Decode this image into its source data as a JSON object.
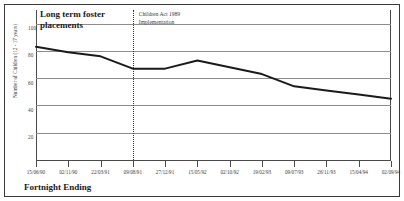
{
  "chart_data": {
    "type": "line",
    "title": "Long term foster placements",
    "xlabel": "Fortnight Ending",
    "ylabel": "Number of Children (12 - 17 years)",
    "ylim": [
      0,
      110
    ],
    "yticks": [
      100,
      80,
      60,
      40,
      20
    ],
    "grid": true,
    "legend": "none",
    "annotations": [
      {
        "text": "Children Act 1989 Implementation",
        "line1": "Children Act 1989",
        "line2": "Implementation",
        "at_x": "09/08/91",
        "style": "vertical-dotted-line"
      }
    ],
    "categories": [
      "15/06/90",
      "02/11/90",
      "22/03/91",
      "09/08/91",
      "27/12/91",
      "15/05/92",
      "02/10/92",
      "19/02/93",
      "09/07/93",
      "26/11/93",
      "15/04/94",
      "02/09/94"
    ],
    "values": [
      83,
      79,
      76,
      67,
      67,
      73,
      68,
      63,
      54,
      51,
      48,
      45
    ],
    "line_color": "#1a1a1a"
  }
}
